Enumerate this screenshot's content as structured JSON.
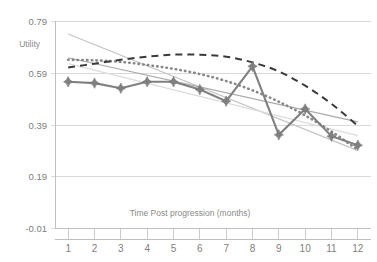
{
  "chart_data": {
    "type": "line",
    "title": "",
    "xlabel": "Time Post progression (months)",
    "ylabel": "Utility",
    "x": [
      1,
      2,
      3,
      4,
      5,
      6,
      7,
      8,
      9,
      10,
      11,
      12
    ],
    "xticklabels": [
      "1",
      "2",
      "3",
      "4",
      "5",
      "6",
      "7",
      "8",
      "9",
      "10",
      "11",
      "12"
    ],
    "yticklabels": [
      "0.79",
      "0.59",
      "0.39",
      "0.19",
      "-0.01"
    ],
    "ytickvalues": [
      0.79,
      0.59,
      0.39,
      0.19,
      -0.01
    ],
    "ylim": [
      -0.01,
      0.79
    ],
    "xlim": [
      0.5,
      12.5
    ],
    "grid": "horizontal",
    "legend": "none",
    "series": [
      {
        "name": "observed-utility",
        "style": "solid-with-diamond-markers",
        "color": "#7f7f7f",
        "values": [
          0.555,
          0.55,
          0.53,
          0.555,
          0.555,
          0.525,
          0.48,
          0.615,
          0.35,
          0.45,
          0.345,
          0.31
        ]
      },
      {
        "name": "dashed-fitted-curve",
        "style": "dashed",
        "color": "#3a3a3a",
        "values": [
          0.61,
          0.625,
          0.64,
          0.652,
          0.66,
          0.66,
          0.652,
          0.63,
          0.595,
          0.54,
          0.47,
          0.385
        ]
      },
      {
        "name": "dotted-fitted-curve",
        "style": "dotted",
        "color": "#888888",
        "values": [
          0.64,
          0.638,
          0.632,
          0.62,
          0.605,
          0.585,
          0.558,
          0.522,
          0.478,
          0.425,
          0.363,
          0.292
        ]
      },
      {
        "name": "steep-linear-trend",
        "style": "thin-solid-light",
        "color": "#c4c4c4",
        "values": [
          0.74,
          0.7,
          0.66,
          0.618,
          0.577,
          0.536,
          0.495,
          0.453,
          0.412,
          0.371,
          0.33,
          0.289
        ]
      },
      {
        "name": "shallow-linear-trend",
        "style": "thin-solid-light",
        "color": "#a8a8a8",
        "values": [
          0.648,
          0.625,
          0.603,
          0.58,
          0.558,
          0.535,
          0.513,
          0.49,
          0.468,
          0.445,
          0.423,
          0.4
        ]
      },
      {
        "name": "lower-linear-trend",
        "style": "thin-solid-lighter",
        "color": "#dcdcdc",
        "values": [
          0.625,
          0.6,
          0.575,
          0.549,
          0.524,
          0.499,
          0.473,
          0.448,
          0.423,
          0.397,
          0.372,
          0.347
        ]
      }
    ]
  }
}
